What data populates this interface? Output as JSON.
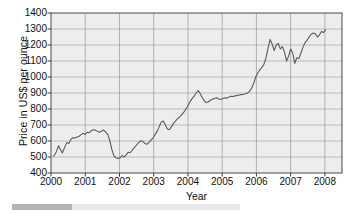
{
  "chart_data": {
    "type": "line",
    "title": "",
    "xlabel": "Year",
    "ylabel": "Price in US$ per ounce",
    "xlim": [
      2000,
      2008.5
    ],
    "ylim": [
      400,
      1400
    ],
    "grid": true,
    "legend": null,
    "ytick_labels": [
      "1400",
      "1300",
      "1200",
      "1100",
      "1000",
      "900",
      "800",
      "700",
      "600",
      "500",
      "400"
    ],
    "ytick_values": [
      1400,
      1300,
      1200,
      1100,
      1000,
      900,
      800,
      700,
      600,
      500,
      400
    ],
    "xtick_labels": [
      "2000",
      "2001",
      "2002",
      "2003",
      "2004",
      "2005",
      "2006",
      "2007",
      "2008"
    ],
    "xtick_values": [
      2000,
      2001,
      2002,
      2003,
      2004,
      2005,
      2006,
      2007,
      2008
    ],
    "series": [
      {
        "name": "Gold price",
        "color": "#5a5a5a",
        "x": [
          2000.08,
          2000.16,
          2000.22,
          2000.28,
          2000.33,
          2000.4,
          2000.46,
          2000.52,
          2000.58,
          2000.64,
          2000.7,
          2000.76,
          2000.82,
          2000.88,
          2000.94,
          2001.0,
          2001.06,
          2001.12,
          2001.18,
          2001.24,
          2001.3,
          2001.36,
          2001.42,
          2001.48,
          2001.54,
          2001.6,
          2001.66,
          2001.72,
          2001.78,
          2001.84,
          2001.9,
          2001.96,
          2002.02,
          2002.08,
          2002.14,
          2002.2,
          2002.26,
          2002.32,
          2002.38,
          2002.44,
          2002.5,
          2002.56,
          2002.62,
          2002.68,
          2002.74,
          2002.8,
          2002.86,
          2002.92,
          2002.98,
          2003.04,
          2003.1,
          2003.16,
          2003.22,
          2003.28,
          2003.34,
          2003.4,
          2003.46,
          2003.52,
          2003.58,
          2003.64,
          2003.7,
          2003.76,
          2003.82,
          2003.88,
          2003.94,
          2004.0,
          2004.06,
          2004.12,
          2004.18,
          2004.24,
          2004.3,
          2004.36,
          2004.42,
          2004.48,
          2004.54,
          2004.6,
          2004.66,
          2004.72,
          2004.78,
          2004.84,
          2004.9,
          2004.96,
          2005.02,
          2005.08,
          2005.14,
          2005.2,
          2005.26,
          2005.32,
          2005.38,
          2005.44,
          2005.5,
          2005.56,
          2005.62,
          2005.68,
          2005.74,
          2005.8,
          2005.86,
          2005.92,
          2005.98,
          2006.04,
          2006.1,
          2006.16,
          2006.22,
          2006.28,
          2006.34,
          2006.4,
          2006.46,
          2006.52,
          2006.58,
          2006.64,
          2006.7,
          2006.76,
          2006.82,
          2006.88,
          2006.94,
          2007.0,
          2007.06,
          2007.12,
          2007.18,
          2007.24,
          2007.3,
          2007.36,
          2007.42,
          2007.48,
          2007.54,
          2007.6,
          2007.66,
          2007.72,
          2007.78,
          2007.84,
          2007.9,
          2007.96,
          2008.02
        ],
        "y": [
          505,
          535,
          570,
          545,
          525,
          560,
          590,
          585,
          610,
          620,
          618,
          625,
          630,
          640,
          648,
          640,
          655,
          652,
          665,
          670,
          668,
          660,
          655,
          662,
          668,
          655,
          640,
          600,
          545,
          505,
          495,
          490,
          495,
          508,
          500,
          515,
          530,
          528,
          545,
          560,
          575,
          590,
          600,
          598,
          585,
          580,
          590,
          605,
          620,
          640,
          660,
          690,
          718,
          725,
          700,
          675,
          670,
          690,
          710,
          725,
          740,
          750,
          765,
          780,
          800,
          820,
          845,
          865,
          880,
          900,
          915,
          895,
          870,
          850,
          840,
          845,
          855,
          862,
          865,
          870,
          862,
          860,
          865,
          870,
          868,
          875,
          880,
          878,
          882,
          885,
          888,
          890,
          892,
          895,
          900,
          910,
          930,
          960,
          1000,
          1025,
          1045,
          1060,
          1080,
          1120,
          1180,
          1235,
          1205,
          1165,
          1200,
          1210,
          1175,
          1190,
          1155,
          1100,
          1130,
          1175,
          1150,
          1085,
          1120,
          1115,
          1150,
          1185,
          1215,
          1230,
          1250,
          1268,
          1275,
          1270,
          1250,
          1262,
          1285,
          1278,
          1295
        ]
      }
    ]
  },
  "scrollbar": {
    "present": true
  }
}
